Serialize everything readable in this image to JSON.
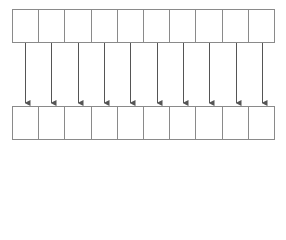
{
  "diagram": {
    "type": "array-mapping",
    "top_row": {
      "cell_count": 10,
      "cells": [
        "",
        "",
        "",
        "",
        "",
        "",
        "",
        "",
        "",
        ""
      ]
    },
    "bottom_row": {
      "cell_count": 10,
      "cells": [
        "",
        "",
        "",
        "",
        "",
        "",
        "",
        "",
        "",
        ""
      ]
    },
    "arrows": {
      "count": 10,
      "direction": "down",
      "mapping": "one-to-one"
    },
    "colors": {
      "border": "#8a8a8a",
      "arrow": "#555555",
      "background": "#ffffff"
    }
  }
}
